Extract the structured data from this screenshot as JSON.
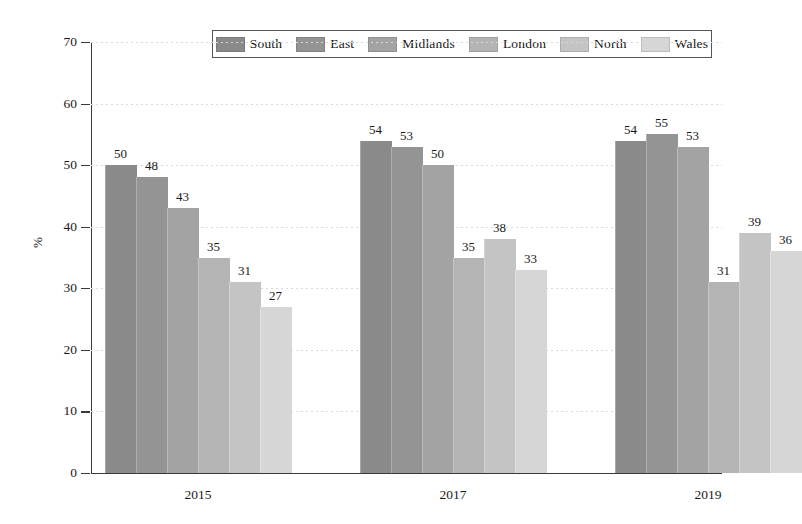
{
  "chart_data": {
    "type": "bar",
    "title": "",
    "xlabel": "",
    "ylabel": "%",
    "categories": [
      "2015",
      "2017",
      "2019"
    ],
    "ylim": [
      0,
      70
    ],
    "yticks": [
      0,
      10,
      20,
      30,
      40,
      50,
      60,
      70
    ],
    "grid": true,
    "legend_position": "top-center",
    "series": [
      {
        "name": "South",
        "color": "#8a8a8a",
        "values": [
          50,
          54,
          54
        ]
      },
      {
        "name": "East",
        "color": "#949494",
        "values": [
          48,
          53,
          55
        ]
      },
      {
        "name": "Midlands",
        "color": "#a3a3a3",
        "values": [
          43,
          50,
          53
        ]
      },
      {
        "name": "London",
        "color": "#b4b4b4",
        "values": [
          35,
          35,
          31
        ]
      },
      {
        "name": "North",
        "color": "#c4c4c4",
        "values": [
          31,
          38,
          39
        ]
      },
      {
        "name": "Wales",
        "color": "#d6d6d6",
        "values": [
          27,
          33,
          36
        ]
      }
    ]
  }
}
